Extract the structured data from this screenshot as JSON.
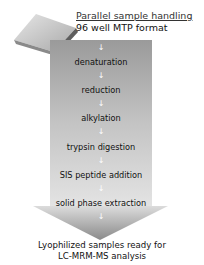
{
  "header": {
    "title": "Parallel sample handling",
    "subtitle": "96 well MTP format",
    "plate_icon": "microtiter-plate-icon"
  },
  "steps": [
    {
      "label": "denaturation"
    },
    {
      "label": "reduction"
    },
    {
      "label": "alkylation"
    },
    {
      "label": "trypsin digestion"
    },
    {
      "label": "SIS peptide addition"
    },
    {
      "label": "solid phase extraction"
    }
  ],
  "arrow_glyph": "↓",
  "result": {
    "line1": "Lyophilized samples ready for",
    "line2": "LC-MRM-MS analysis"
  },
  "colors": {
    "arrow_light": "#d9d9d9",
    "arrow_dark": "#8c8c8c",
    "plate_top": "#c8c8c8",
    "plate_side": "#6e6e6e"
  }
}
